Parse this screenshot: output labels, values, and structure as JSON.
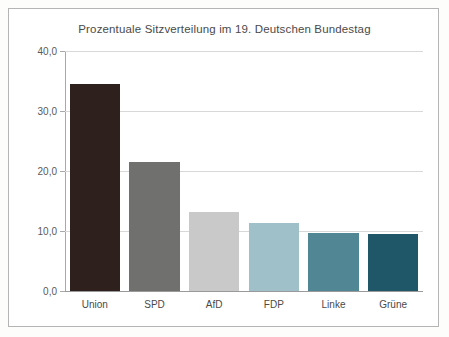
{
  "chart_data": {
    "type": "bar",
    "title": "Prozentuale Sitzverteilung im 19. Deutschen Bundestag",
    "xlabel": "",
    "ylabel": "",
    "categories": [
      "Union",
      "SPD",
      "AfD",
      "FDP",
      "Linke",
      "Grüne"
    ],
    "values": [
      34.5,
      21.5,
      13.2,
      11.3,
      9.7,
      9.5
    ],
    "ylim": [
      0.0,
      40.0
    ],
    "ytick_labels": [
      "40,0",
      "30,0",
      "20,0",
      "10,0",
      "0,0"
    ],
    "ytick_values": [
      40.0,
      30.0,
      20.0,
      10.0,
      0.0
    ],
    "grid": true,
    "legend": "none",
    "bar_colors": [
      "#2e201c",
      "#70706f",
      "#c9c9c9",
      "#9fc0c9",
      "#518694",
      "#1f5668"
    ]
  },
  "style": {
    "page_background": "#fdfdfb",
    "card_background": "#ffffff",
    "card_border": "#b5b5b5",
    "gridline_color": "#d8d8d8",
    "axis_color": "#a8a8a8",
    "title_color": "#4a4a4a",
    "label_color": "#4a4a4a"
  }
}
